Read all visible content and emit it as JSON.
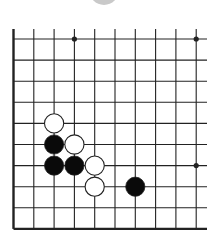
{
  "board": {
    "description": "Go problem diagram, lower-left corner of board",
    "columns": 10,
    "rows": 10,
    "edges": {
      "left": true,
      "bottom": true,
      "top": false,
      "right": false
    },
    "star_points": [
      {
        "col": 3,
        "row": 0
      },
      {
        "col": 9,
        "row": 0
      },
      {
        "col": 9,
        "row": 6
      }
    ],
    "stones": [
      {
        "color": "white",
        "col": 2,
        "row": 4
      },
      {
        "color": "black",
        "col": 2,
        "row": 5
      },
      {
        "color": "white",
        "col": 3,
        "row": 5
      },
      {
        "color": "black",
        "col": 2,
        "row": 6
      },
      {
        "color": "black",
        "col": 3,
        "row": 6
      },
      {
        "color": "white",
        "col": 4,
        "row": 6
      },
      {
        "color": "white",
        "col": 4,
        "row": 7
      },
      {
        "color": "black",
        "col": 6,
        "row": 7
      }
    ],
    "colors": {
      "line": "#222222",
      "black_stone": "#0a0a0a",
      "white_stone": "#ffffff",
      "indicator": "#c9c9c9"
    }
  },
  "indicator": {
    "shape": "circle",
    "color": "#c9c9c9"
  }
}
